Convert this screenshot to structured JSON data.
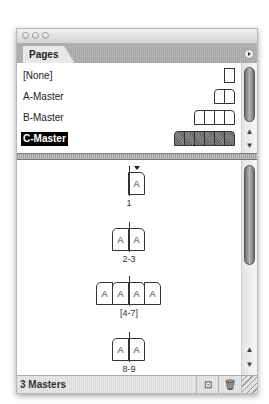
{
  "window": {
    "title": ""
  },
  "tabs": [
    {
      "label": "Pages"
    }
  ],
  "masters": [
    {
      "label": "[None]",
      "pages": 1,
      "selected": false
    },
    {
      "label": "A-Master",
      "pages": 2,
      "selected": false
    },
    {
      "label": "B-Master",
      "pages": 4,
      "selected": false
    },
    {
      "label": "C-Master",
      "pages": 6,
      "selected": true
    }
  ],
  "spreads": [
    {
      "label": "1",
      "pages": [
        "A"
      ],
      "current": true
    },
    {
      "label": "2-3",
      "pages": [
        "A",
        "A"
      ],
      "current": false
    },
    {
      "label": "[4-7]",
      "pages": [
        "A",
        "A",
        "A",
        "A"
      ],
      "current": false
    },
    {
      "label": "8-9",
      "pages": [
        "A",
        "A"
      ],
      "current": false
    }
  ],
  "status": {
    "text": "3 Masters"
  },
  "icons": {
    "new_page": "new-page-icon",
    "delete": "trash-icon",
    "panel_menu": "panel-menu-icon"
  },
  "scroll_arrows": {
    "up": "▲",
    "down": "▼"
  },
  "bottom_buttons": {
    "new_page_glyph": "⊡",
    "trash_glyph": "🗑"
  }
}
